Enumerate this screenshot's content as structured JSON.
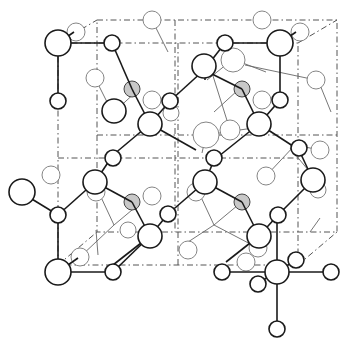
{
  "diagram": {
    "title": "",
    "type": "crystal-structure-ball-and-stick",
    "width": 349,
    "height": 347
  }
}
